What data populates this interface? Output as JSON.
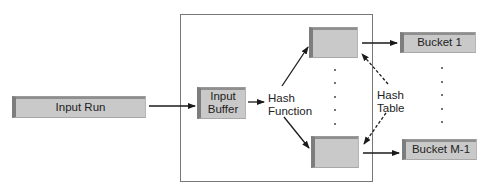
{
  "diagram": {
    "title": "",
    "nodes": {
      "input_run": "Input Run",
      "input_buffer_line1": "Input",
      "input_buffer_line2": "Buffer",
      "hash_slot_top": "",
      "hash_slot_bottom": "",
      "bucket_1": "Bucket 1",
      "bucket_m1": "Bucket M-1"
    },
    "labels": {
      "hash_function_line1": "Hash",
      "hash_function_line2": "Function",
      "hash_table_line1": "Hash",
      "hash_table_line2": "Table"
    },
    "edges": [
      {
        "from": "Input Run",
        "to": "Input Buffer",
        "style": "solid"
      },
      {
        "from": "Input Buffer",
        "to": "Hash Function",
        "style": "solid"
      },
      {
        "from": "Hash Function",
        "to": "hash slot top",
        "style": "solid"
      },
      {
        "from": "Hash Function",
        "to": "hash slot bottom",
        "style": "solid"
      },
      {
        "from": "hash slot top",
        "to": "Bucket 1",
        "style": "solid"
      },
      {
        "from": "hash slot bottom",
        "to": "Bucket M-1",
        "style": "solid"
      },
      {
        "from": "Hash Table",
        "to": "hash slot top",
        "style": "dashed"
      },
      {
        "from": "Hash Table",
        "to": "hash slot bottom",
        "style": "dashed"
      }
    ],
    "colors": {
      "box_fill": "#c9c9c9",
      "box_edge": "#7d7d7d",
      "line": "#1a1a1a",
      "frame": "#777777"
    }
  }
}
